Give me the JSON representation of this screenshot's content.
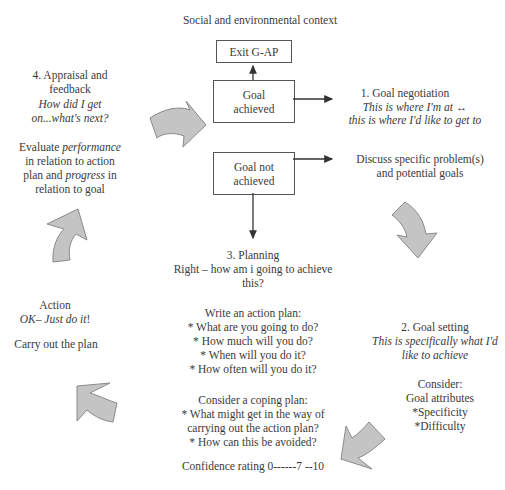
{
  "title": "Social and environmental context",
  "boxes": {
    "exit": "Exit G-AP",
    "goal_achieved": [
      "Goal",
      "achieved"
    ],
    "goal_not_achieved": [
      "Goal not",
      "achieved"
    ]
  },
  "stage1": {
    "heading": "1. Goal negotiation",
    "line1": "This is where I'm at",
    "arrow_symbol": "↔",
    "line2": "this is where I'd like to get to"
  },
  "discuss": {
    "line1": "Discuss specific problem(s)",
    "line2": "and potential goals"
  },
  "stage2": {
    "heading": "2. Goal setting",
    "line1": "This is specifically what I'd",
    "line2": "like to achieve",
    "consider": {
      "line1": "Consider:",
      "line2": "Goal attributes",
      "items": [
        "*Specificity",
        "*Difficulty"
      ]
    }
  },
  "stage3": {
    "heading": "3. Planning",
    "line1": "Right – how am i going to achieve",
    "line2": "this?",
    "action_plan": {
      "heading": "Write an action plan:",
      "items": [
        "* What are you going to do?",
        "* How much will you do?",
        "* When will you do it?",
        "* How often will you do it?"
      ]
    },
    "coping_plan": {
      "heading": "Consider a coping plan:",
      "items": [
        "* What might get in the way of",
        "carrying out the action plan?",
        "* How can this be avoided?"
      ]
    },
    "confidence": "Confidence rating 0------7 --10"
  },
  "action": {
    "heading": "Action",
    "tagline_prefix": "OK– ",
    "tagline_italic": "Just do it",
    "tagline_suffix": "!",
    "line": "Carry out the plan"
  },
  "stage4": {
    "heading_line1": "4. Appraisal and",
    "heading_line2": "feedback",
    "q_line1": "How did I get",
    "q_line2": "on...what's next?",
    "eval": {
      "p1": "Evaluate ",
      "p1_italic": "performance",
      "p2": "in relation to action",
      "p3": "plan and ",
      "p3_italic": "progress",
      "p3_suffix": " in",
      "p4": "relation to goal"
    }
  },
  "colors": {
    "arrow_fill": "#c4c4c4",
    "arrow_stroke": "#8a8a8a",
    "line": "#333333",
    "text": "#3a3a3a"
  }
}
